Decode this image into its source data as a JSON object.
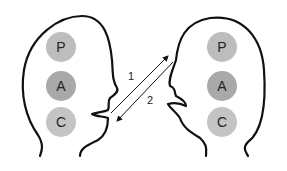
{
  "diagram": {
    "type": "transactional-analysis",
    "left_head": {
      "states": [
        {
          "label": "P",
          "color": "#bdbdbd"
        },
        {
          "label": "A",
          "color": "#a9a9a9"
        },
        {
          "label": "C",
          "color": "#c4c4c4"
        }
      ]
    },
    "right_head": {
      "states": [
        {
          "label": "P",
          "color": "#bdbdbd"
        },
        {
          "label": "A",
          "color": "#a9a9a9"
        },
        {
          "label": "C",
          "color": "#c4c4c4"
        }
      ]
    },
    "arrows": [
      {
        "label": "1",
        "direction": "left-to-right"
      },
      {
        "label": "2",
        "direction": "right-to-left"
      }
    ]
  }
}
